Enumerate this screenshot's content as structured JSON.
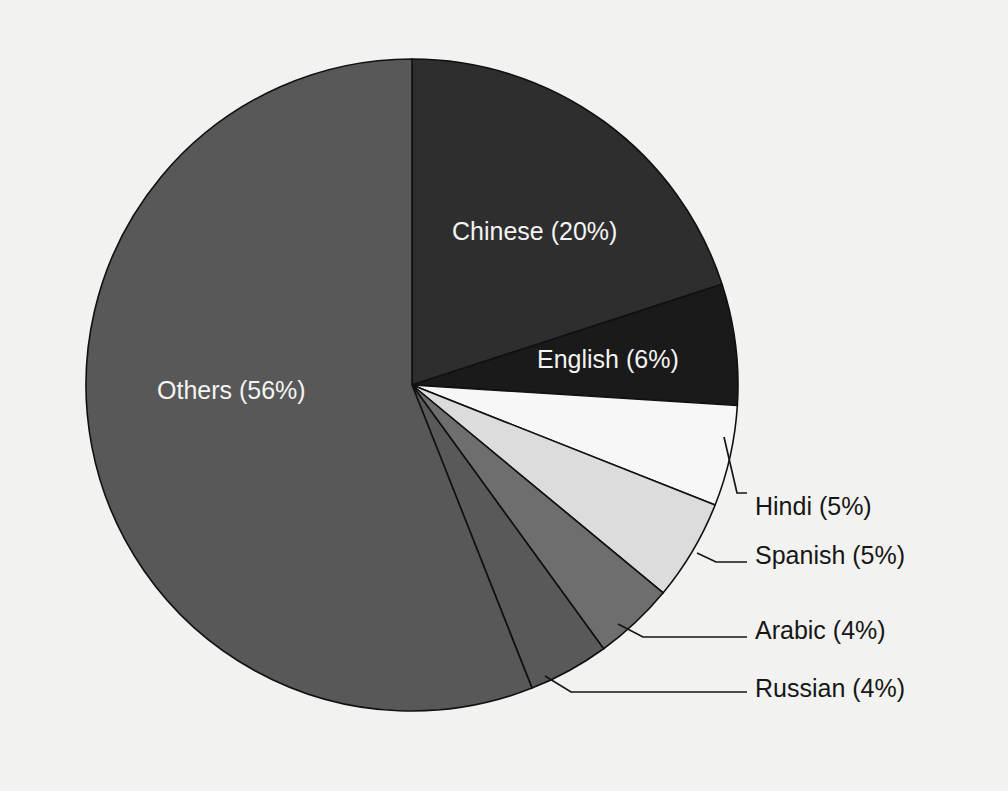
{
  "figure": {
    "background_color": "#f2f2f0",
    "center_x": 412,
    "center_y": 385,
    "radius": 326,
    "start_angle_deg": -90,
    "direction": "clockwise"
  },
  "chart_data": {
    "type": "pie",
    "title": "",
    "subtitle": "",
    "xlabel": "",
    "ylabel": "",
    "legend_position": "none",
    "grid": false,
    "total_percent": 100,
    "categories": [
      "Chinese",
      "English",
      "Hindi",
      "Spanish",
      "Arabic",
      "Russian",
      "Others"
    ],
    "values": [
      20,
      6,
      5,
      5,
      4,
      4,
      56
    ],
    "labels": [
      "Chinese (20%)",
      "English (6%)",
      "Hindi (5%)",
      "Spanish (5%)",
      "Arabic (4%)",
      "Russian (4%)",
      "Others (56%)"
    ],
    "colors": [
      "#2e2e2e",
      "#1a1a1a",
      "#f7f7f7",
      "#dcdcdc",
      "#6e6e6e",
      "#595959",
      "#585858"
    ],
    "slices": [
      {
        "name": "Chinese",
        "label": "Chinese (20%)",
        "value": 20,
        "color": "#2e2e2e",
        "label_placement": "inside",
        "label_color": "#f4f4f4",
        "label_x": 452,
        "label_y": 233,
        "label_anchor": "start"
      },
      {
        "name": "English",
        "label": "English (6%)",
        "value": 6,
        "color": "#1a1a1a",
        "label_placement": "inside",
        "label_color": "#f4f4f4",
        "label_x": 537,
        "label_y": 361,
        "label_anchor": "start"
      },
      {
        "name": "Hindi",
        "label": "Hindi (5%)",
        "value": 5,
        "color": "#f7f7f7",
        "label_placement": "outside",
        "label_color": "#161616",
        "label_x": 755,
        "label_y": 508,
        "label_anchor": "start",
        "leader": "M 724,437 L 737,493 L 747,493"
      },
      {
        "name": "Spanish",
        "label": "Spanish (5%)",
        "value": 5,
        "color": "#dcdcdc",
        "label_placement": "outside",
        "label_color": "#161616",
        "label_x": 755,
        "label_y": 557,
        "label_anchor": "start",
        "leader": "M 697,553 L 716,562 L 747,562"
      },
      {
        "name": "Arabic",
        "label": "Arabic (4%)",
        "value": 4,
        "color": "#6e6e6e",
        "label_placement": "outside",
        "label_color": "#161616",
        "label_x": 755,
        "label_y": 632,
        "label_anchor": "start",
        "leader": "M 618,624 L 643,637 L 747,637"
      },
      {
        "name": "Russian",
        "label": "Russian (4%)",
        "value": 4,
        "color": "#595959",
        "label_placement": "outside",
        "label_color": "#161616",
        "label_x": 755,
        "label_y": 690,
        "label_anchor": "start",
        "leader": "M 545,676 L 571,692 L 747,692"
      },
      {
        "name": "Others",
        "label": "Others (56%)",
        "value": 56,
        "color": "#585858",
        "label_placement": "inside",
        "label_color": "#f4f4f4",
        "label_x": 157,
        "label_y": 392,
        "label_anchor": "start"
      }
    ]
  }
}
